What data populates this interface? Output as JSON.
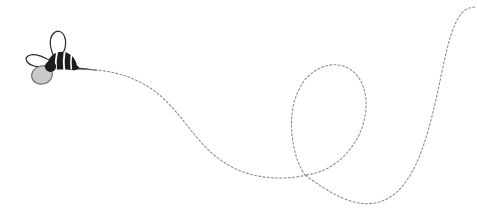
{
  "canvas": {
    "width": 477,
    "height": 219,
    "background_color": "#ffffff",
    "title": "Bee with dashed flight path"
  },
  "illustration": {
    "subject_label": "Cartoon bee",
    "trail_label": "Dashed flight trail",
    "colors": {
      "background": "#ffffff",
      "trail": "#8d8d95",
      "trail_solid": "#3a3a3a",
      "body_dark": "#1d1d1d",
      "body_stripe": "#fbfbfb",
      "wing_fill": "#ffffff",
      "wing_outline": "#2b2b2b",
      "lower_wing_fill": "#c9c9c9",
      "lower_wing_outline": "#6f6f6f"
    },
    "bee": {
      "position_x": 52,
      "position_y": 64,
      "upper_wing_label": "Upper wing",
      "second_wing_label": "Second wing",
      "lower_wing_label": "Lower rounded wing",
      "body_label": "Striped abdomen",
      "head_label": "Head",
      "stinger_label": "Stinger tip"
    },
    "trail": {
      "dash_length": 2,
      "dash_gap": 2.2,
      "stroke_width": 1.1,
      "start_x": 76,
      "start_y": 68,
      "end_x": 476,
      "end_y": 7,
      "crossing_x": 305,
      "crossing_y": 175,
      "loop_apex_x": 333,
      "loop_apex_y": 68,
      "valley_x": 372,
      "valley_y": 203,
      "peak_x": 462,
      "peak_y": 9,
      "solid_segment_end_x": 95,
      "solid_segment_end_y": 70
    }
  }
}
